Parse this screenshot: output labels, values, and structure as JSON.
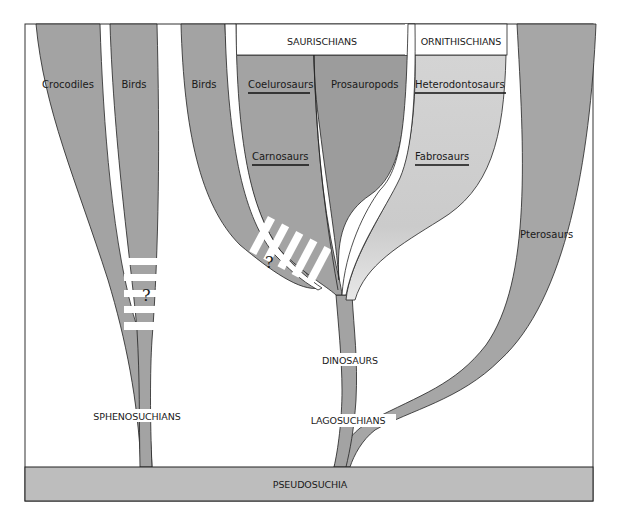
{
  "figure": {
    "type": "phylogenetic-diagram",
    "base_label": "PSEUDOSUCHIA",
    "groups": {
      "saurischians": "SAURISCHIANS",
      "ornithischians": "ORNITHISCHIANS"
    },
    "branches": {
      "crocodiles": "Crocodiles",
      "birds_left": "Birds",
      "birds_middle": "Birds",
      "coelurosaurs": "Coelurosaurs",
      "carnosaurs": "Carnosaurs",
      "prosauropods": "Prosauropods",
      "heterodontosaurs": "Heterodontosaurs",
      "fabrosaurs": "Fabrosaurs",
      "pterosaurs": "Pterosaurs"
    },
    "stems": {
      "sphenosuchians": "SPHENOSUCHIANS",
      "dinosaurs": "DINOSAURS",
      "lagosuchians": "LAGOSUCHIANS"
    },
    "uncertainty_marks": [
      "?",
      "?"
    ],
    "colors": {
      "branch_gray": "#a3a3a3",
      "branch_dark": "#9a9a9a",
      "ornithischian_light": "#cfcfcf",
      "base_gray": "#bdbdbd",
      "outline": "#222222",
      "background": "#ffffff"
    }
  }
}
